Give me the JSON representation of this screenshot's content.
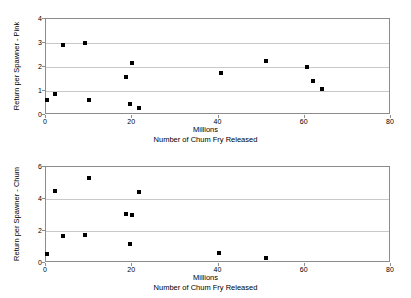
{
  "figure": {
    "background": "#ffffff",
    "point_color": "#000000",
    "gridline_color": "#c9c9c9",
    "axis_color": "#8c8c8c"
  },
  "charts": [
    {
      "id": "pink",
      "ylabel": "Return per Spawner - Pink",
      "xlabel_unit": "Millions",
      "xlabel_main": "Number of Chum Fry Released",
      "yticks": [
        "0",
        "1",
        "2",
        "3",
        "4"
      ],
      "xticks": [
        "0",
        "20",
        "40",
        "60",
        "80"
      ]
    },
    {
      "id": "chum",
      "ylabel": "Return per Spawner - Chum",
      "xlabel_unit": "Millions",
      "xlabel_main": "Number of Chum Fry Released",
      "yticks": [
        "0",
        "2",
        "4",
        "6"
      ],
      "xticks": [
        "0",
        "20",
        "40",
        "60",
        "80"
      ]
    }
  ],
  "chart_data": [
    {
      "type": "scatter",
      "title": "",
      "xlabel": "Number of Chum Fry Released (Millions)",
      "ylabel": "Return per Spawner - Pink",
      "xlim": [
        0,
        80
      ],
      "ylim": [
        0,
        4
      ],
      "xticks": [
        0,
        20,
        40,
        60,
        80
      ],
      "yticks": [
        0,
        1,
        2,
        3,
        4
      ],
      "grid": "horizontal",
      "legend": "none",
      "series": [
        {
          "name": "Return per Spawner - Pink",
          "marker": "square",
          "color": "#000000",
          "points": [
            [
              0.3,
              0.62
            ],
            [
              2.0,
              0.87
            ],
            [
              4.0,
              2.9
            ],
            [
              9.0,
              3.0
            ],
            [
              10.0,
              0.62
            ],
            [
              18.5,
              1.6
            ],
            [
              19.5,
              0.45
            ],
            [
              20.0,
              2.18
            ],
            [
              21.5,
              0.28
            ],
            [
              40.5,
              1.75
            ],
            [
              51.0,
              2.23
            ],
            [
              60.5,
              2.0
            ],
            [
              62.0,
              1.43
            ],
            [
              64.0,
              1.08
            ]
          ]
        }
      ]
    },
    {
      "type": "scatter",
      "title": "",
      "xlabel": "Number of Chum Fry Released (Millions)",
      "ylabel": "Return per Spawner - Chum",
      "xlim": [
        0,
        80
      ],
      "ylim": [
        0,
        6
      ],
      "xticks": [
        0,
        20,
        40,
        60,
        80
      ],
      "yticks": [
        0,
        2,
        4,
        6
      ],
      "grid": "horizontal",
      "legend": "none",
      "series": [
        {
          "name": "Return per Spawner - Chum",
          "marker": "square",
          "color": "#000000",
          "points": [
            [
              0.3,
              0.55
            ],
            [
              2.0,
              4.5
            ],
            [
              4.0,
              1.68
            ],
            [
              9.0,
              1.75
            ],
            [
              10.0,
              5.33
            ],
            [
              18.5,
              3.08
            ],
            [
              19.5,
              1.2
            ],
            [
              20.0,
              2.97
            ],
            [
              21.5,
              4.43
            ],
            [
              40.0,
              0.65
            ],
            [
              51.0,
              0.33
            ]
          ]
        }
      ]
    }
  ]
}
